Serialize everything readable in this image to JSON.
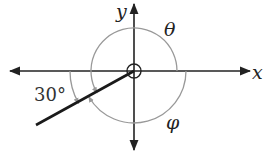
{
  "diagram": {
    "type": "angle-diagram",
    "origin": {
      "x": 134,
      "y": 71
    },
    "axes": {
      "x_label": "x",
      "y_label": "y"
    },
    "ray": {
      "angle_below_negative_x_deg": 30
    },
    "angles": [
      {
        "name": "theta",
        "label": "θ",
        "description": "counterclockwise from positive x-axis to ray"
      },
      {
        "name": "phi",
        "label": "φ",
        "description": "clockwise from positive x-axis to ray"
      },
      {
        "name": "reference",
        "label": "30°",
        "description": "from negative x-axis down to ray"
      }
    ],
    "colors": {
      "axis": "#222222",
      "arc": "#999999",
      "ray": "#1a1a1a"
    }
  }
}
